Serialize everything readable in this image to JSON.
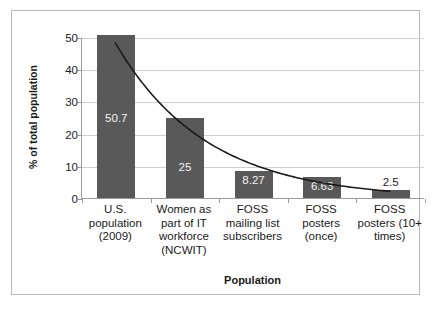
{
  "chart_data": {
    "type": "bar",
    "title": "",
    "subtitle": "",
    "xlabel": "Population",
    "ylabel": "% of total population",
    "categories": [
      "U.S. population (2009)",
      "Women as part of IT workforce (NCWIT)",
      "FOSS mailing list subscribers",
      "FOSS posters (once)",
      "FOSS posters (10+ times)"
    ],
    "category_lines": [
      [
        "U.S.",
        "population",
        "(2009)"
      ],
      [
        "Women as",
        "part of IT",
        "workforce",
        "(NCWIT)"
      ],
      [
        "FOSS",
        "mailing list",
        "subscribers"
      ],
      [
        "FOSS",
        "posters",
        "(once)"
      ],
      [
        "FOSS",
        "posters (10+",
        "times)"
      ]
    ],
    "values": [
      50.7,
      25,
      8.27,
      6.63,
      2.5
    ],
    "data_labels": [
      "50.7",
      "25",
      "8.27",
      "6.63",
      "2.5"
    ],
    "ylim": [
      0,
      50
    ],
    "yticks": [
      0,
      10,
      20,
      30,
      40,
      50
    ],
    "ytick_labels": [
      "0",
      "10",
      "20",
      "30",
      "40",
      "50"
    ],
    "grid": true,
    "legend": "none",
    "series": [
      {
        "name": "% of total population",
        "values": [
          50.7,
          25,
          8.27,
          6.63,
          2.5
        ],
        "color": "#595959"
      },
      {
        "name": "trendline",
        "type": "line",
        "fit": "exponential",
        "color": "#1a1a1a",
        "values": [
          48.5,
          22.0,
          10.5,
          5.2,
          2.4
        ]
      }
    ]
  },
  "colors": {
    "bar": "#595959",
    "trendline": "#1a1a1a",
    "gridline": "#cfcfcf",
    "axis": "#9a9a9a",
    "frame": "#b9b9b9",
    "background": "#ffffff",
    "text": "#1a1a1a",
    "bar_label_text": "#f2f2f2"
  }
}
